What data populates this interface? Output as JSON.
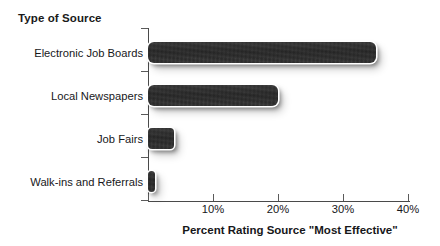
{
  "chart_data": {
    "type": "bar",
    "orientation": "horizontal",
    "title": "",
    "ylabel": "Type of Source",
    "xlabel": "Percent Rating Source \"Most Effective\"",
    "categories": [
      "Electronic Job Boards",
      "Local Newspapers",
      "Job Fairs",
      "Walk-ins and Referrals"
    ],
    "values": [
      35,
      20,
      4,
      1
    ],
    "xlim": [
      0,
      40
    ],
    "xticks": [
      0,
      10,
      20,
      30,
      40
    ],
    "xtick_labels": [
      "",
      "10%",
      "20%",
      "30%",
      "40%"
    ],
    "grid": false,
    "legend": null,
    "series": [
      {
        "name": "Percent Rating Source \"Most Effective\"",
        "values": [
          35,
          20,
          4,
          1
        ]
      }
    ],
    "bar_color": "#2b2b2b",
    "axis_color": "#4a4a4a",
    "background_color": "#ffffff"
  },
  "axes": {
    "y_axis_title": "Type of Source",
    "x_axis_title": "Percent Rating Source \"Most Effective\"",
    "x_tick_labels": [
      "10%",
      "20%",
      "30%",
      "40%"
    ]
  },
  "bars": [
    {
      "label": "Electronic Job Boards",
      "value": 35
    },
    {
      "label": "Local Newspapers",
      "value": 20
    },
    {
      "label": "Job Fairs",
      "value": 4
    },
    {
      "label": "Walk-ins and Referrals",
      "value": 1
    }
  ]
}
